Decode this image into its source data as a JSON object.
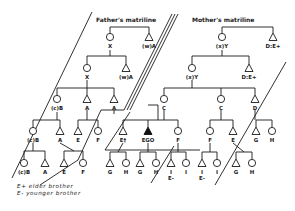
{
  "diagram": {
    "type": "kinship-chart",
    "titles": {
      "father": "Father's matriline",
      "mother": "Mother's matriline"
    },
    "legend": [
      {
        "symbol": "E+",
        "meaning": "elder brother",
        "text": "E+ elder brother"
      },
      {
        "symbol": "E-",
        "meaning": "younger brother",
        "text": "E- younger brother"
      }
    ],
    "symbols": {
      "circle": "female",
      "triangle": "male",
      "filled-triangle": "ego"
    },
    "nodes": [
      {
        "id": "f1x",
        "shape": "circle",
        "label": "X",
        "x": 110,
        "y": 37
      },
      {
        "id": "f1a",
        "shape": "triangle",
        "label": "(w)A",
        "x": 149,
        "y": 37
      },
      {
        "id": "f2x",
        "shape": "circle",
        "label": "X",
        "x": 87,
        "y": 68
      },
      {
        "id": "f2a",
        "shape": "triangle",
        "label": "(w)A",
        "x": 126,
        "y": 68
      },
      {
        "id": "f3b",
        "shape": "circle",
        "label": "(c)B",
        "x": 57,
        "y": 99
      },
      {
        "id": "f3a",
        "shape": "triangle",
        "label": "A",
        "x": 87,
        "y": 99
      },
      {
        "id": "f3a2",
        "shape": "triangle",
        "label": "A",
        "x": 114,
        "y": 99
      },
      {
        "id": "f4b",
        "shape": "circle",
        "label": "(c)B",
        "x": 33,
        "y": 131
      },
      {
        "id": "f4a",
        "shape": "triangle",
        "label": "A",
        "x": 60,
        "y": 131
      },
      {
        "id": "f4e",
        "shape": "triangle",
        "label": "E",
        "x": 78,
        "y": 131
      },
      {
        "id": "f4f",
        "shape": "circle",
        "label": "F",
        "x": 98,
        "y": 131
      },
      {
        "id": "f5b",
        "shape": "circle",
        "label": "(c)B",
        "x": 24,
        "y": 163
      },
      {
        "id": "f5a",
        "shape": "triangle",
        "label": "A",
        "x": 45,
        "y": 163
      },
      {
        "id": "f5e",
        "shape": "triangle",
        "label": "E",
        "x": 64,
        "y": 163
      },
      {
        "id": "f5f",
        "shape": "circle",
        "label": "F",
        "x": 83,
        "y": 163
      },
      {
        "id": "m1y",
        "shape": "circle",
        "label": "(x)Y",
        "x": 222,
        "y": 37
      },
      {
        "id": "m1d",
        "shape": "triangle",
        "label": "D:E+",
        "x": 273,
        "y": 37
      },
      {
        "id": "m2y",
        "shape": "circle",
        "label": "(x)Y",
        "x": 192,
        "y": 68
      },
      {
        "id": "m2d",
        "shape": "triangle",
        "label": "D:E+",
        "x": 249,
        "y": 68
      },
      {
        "id": "m3c1",
        "shape": "circle",
        "label": "C",
        "x": 164,
        "y": 99
      },
      {
        "id": "m3c2",
        "shape": "circle",
        "label": "C",
        "x": 221,
        "y": 99
      },
      {
        "id": "m3d",
        "shape": "triangle",
        "label": "D",
        "x": 255,
        "y": 99
      },
      {
        "id": "ep",
        "shape": "triangle",
        "label": "E†",
        "x": 123,
        "y": 131
      },
      {
        "id": "ego",
        "shape": "filled-triangle",
        "label": "EGO",
        "x": 148,
        "y": 131
      },
      {
        "id": "ef",
        "shape": "circle",
        "label": "F",
        "x": 178,
        "y": 131
      },
      {
        "id": "mf",
        "shape": "circle",
        "label": "F",
        "x": 210,
        "y": 131
      },
      {
        "id": "me",
        "shape": "triangle",
        "label": "E",
        "x": 233,
        "y": 131
      },
      {
        "id": "mg",
        "shape": "triangle",
        "label": "G",
        "x": 256,
        "y": 131
      },
      {
        "id": "mh",
        "shape": "circle",
        "label": "H",
        "x": 272,
        "y": 131
      },
      {
        "id": "g1",
        "shape": "triangle",
        "label": "G",
        "x": 110,
        "y": 163
      },
      {
        "id": "h1",
        "shape": "circle",
        "label": "H",
        "x": 126,
        "y": 163
      },
      {
        "id": "g2",
        "shape": "triangle",
        "label": "G",
        "x": 140,
        "y": 163
      },
      {
        "id": "h2",
        "shape": "circle",
        "label": "H",
        "x": 156,
        "y": 163
      },
      {
        "id": "i1",
        "shape": "triangle",
        "label": "I",
        "sublabel": "E-",
        "x": 171,
        "y": 163
      },
      {
        "id": "i2",
        "shape": "circle",
        "label": "I",
        "x": 186,
        "y": 163
      },
      {
        "id": "i3",
        "shape": "triangle",
        "label": "I",
        "sublabel": "E-",
        "x": 202,
        "y": 163
      },
      {
        "id": "i4",
        "shape": "circle",
        "label": "I",
        "x": 217,
        "y": 163
      },
      {
        "id": "g3",
        "shape": "triangle",
        "label": "G",
        "x": 236,
        "y": 163
      },
      {
        "id": "h3",
        "shape": "circle",
        "label": "H",
        "x": 252,
        "y": 163
      }
    ]
  }
}
